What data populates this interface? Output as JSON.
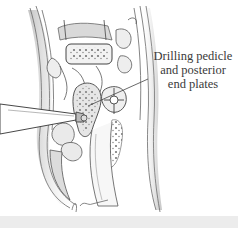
{
  "illustration": {
    "subject": "surgical-spine-exposure",
    "callout": {
      "lines": [
        "Drilling pedicle",
        "and posterior",
        "end plates"
      ]
    },
    "signature": "J. Hess",
    "colors": {
      "ink": "#3a3a3a",
      "shade": "#8a8a8a",
      "background": "#ffffff",
      "band": "#ececec"
    }
  }
}
